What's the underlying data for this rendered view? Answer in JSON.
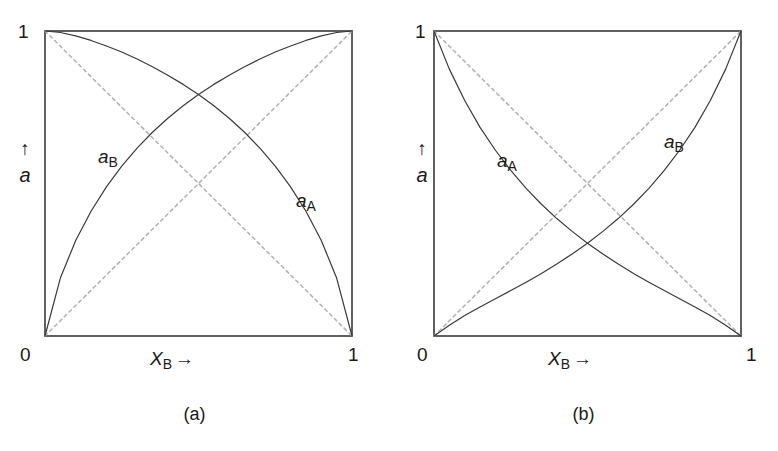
{
  "figure": {
    "background": "#ffffff",
    "ink_color": "#3a3a3a",
    "dashed_color": "#b0b0b0"
  },
  "panels": [
    {
      "id": "a",
      "caption": "(a)",
      "axes": {
        "x_label_var": "X",
        "x_label_sub": "B",
        "x_label_arrow": "→",
        "y_label_arrow": "↑",
        "y_label_var": "a",
        "x_tick_min": "0",
        "x_tick_max": "1",
        "y_tick_max": "1",
        "xlim": [
          0,
          1
        ],
        "ylim": [
          0,
          1
        ]
      },
      "curve_labels": [
        {
          "name": "a_B",
          "var": "a",
          "sub": "B",
          "x_px": 98,
          "y_px": 146
        },
        {
          "name": "a_A",
          "var": "a",
          "sub": "A",
          "x_px": 296,
          "y_px": 190
        }
      ]
    },
    {
      "id": "b",
      "caption": "(b)",
      "axes": {
        "x_label_var": "X",
        "x_label_sub": "B",
        "x_label_arrow": "→",
        "y_label_arrow": "↑",
        "y_label_var": "a",
        "x_tick_min": "0",
        "x_tick_max": "1",
        "y_tick_max": "1",
        "xlim": [
          0,
          1
        ],
        "ylim": [
          0,
          1
        ]
      },
      "curve_labels": [
        {
          "name": "a_A",
          "var": "a",
          "sub": "A",
          "x_px": 108,
          "y_px": 150
        },
        {
          "name": "a_B",
          "var": "a",
          "sub": "B",
          "x_px": 275,
          "y_px": 131
        }
      ]
    }
  ],
  "chart_data": [
    {
      "type": "line",
      "panel": "a",
      "title": "",
      "subtitle": "Positive deviation from Raoult's law",
      "xlabel": "X_B →",
      "ylabel": "a ↑",
      "xlim": [
        0,
        1
      ],
      "ylim": [
        0,
        1
      ],
      "xticks": [
        0,
        1
      ],
      "xticklabels": [
        "0",
        "1"
      ],
      "yticks": [
        0,
        1
      ],
      "yticklabels": [
        "",
        "1"
      ],
      "grid": false,
      "legend": "inline-curve-labels",
      "x": [
        0,
        0.05,
        0.1,
        0.15,
        0.2,
        0.25,
        0.3,
        0.35,
        0.4,
        0.45,
        0.5,
        0.55,
        0.6,
        0.65,
        0.7,
        0.75,
        0.8,
        0.85,
        0.9,
        0.95,
        1
      ],
      "series": [
        {
          "name": "a_A",
          "style": "solid",
          "values": [
            1,
            0.995,
            0.984,
            0.969,
            0.951,
            0.931,
            0.908,
            0.883,
            0.855,
            0.825,
            0.792,
            0.755,
            0.714,
            0.668,
            0.616,
            0.557,
            0.489,
            0.409,
            0.313,
            0.19,
            0
          ]
        },
        {
          "name": "a_B",
          "style": "solid",
          "values": [
            0,
            0.19,
            0.313,
            0.409,
            0.489,
            0.557,
            0.616,
            0.668,
            0.714,
            0.755,
            0.792,
            0.825,
            0.855,
            0.883,
            0.908,
            0.931,
            0.951,
            0.969,
            0.984,
            0.995,
            1
          ]
        },
        {
          "name": "Raoult ideal a_A",
          "style": "dashed",
          "values": [
            1,
            0.95,
            0.9,
            0.85,
            0.8,
            0.75,
            0.7,
            0.65,
            0.6,
            0.55,
            0.5,
            0.45,
            0.4,
            0.35,
            0.3,
            0.25,
            0.2,
            0.15,
            0.1,
            0.05,
            0
          ]
        },
        {
          "name": "Raoult ideal a_B",
          "style": "dashed",
          "values": [
            0,
            0.05,
            0.1,
            0.15,
            0.2,
            0.25,
            0.3,
            0.35,
            0.4,
            0.45,
            0.5,
            0.55,
            0.6,
            0.65,
            0.7,
            0.75,
            0.8,
            0.85,
            0.9,
            0.95,
            1
          ]
        }
      ],
      "annotations": [
        {
          "text": "a_B",
          "x": 0.17,
          "y": 0.62
        },
        {
          "text": "a_A",
          "x": 0.82,
          "y": 0.48
        }
      ],
      "crossing_point": {
        "x": 0.5,
        "y": 0.71
      }
    },
    {
      "type": "line",
      "panel": "b",
      "title": "",
      "subtitle": "Negative deviation from Raoult's law",
      "xlabel": "X_B →",
      "ylabel": "a ↑",
      "xlim": [
        0,
        1
      ],
      "ylim": [
        0,
        1
      ],
      "xticks": [
        0,
        1
      ],
      "xticklabels": [
        "0",
        "1"
      ],
      "yticks": [
        0,
        1
      ],
      "yticklabels": [
        "",
        "1"
      ],
      "grid": false,
      "legend": "inline-curve-labels",
      "x": [
        0,
        0.05,
        0.1,
        0.15,
        0.2,
        0.25,
        0.3,
        0.35,
        0.4,
        0.45,
        0.5,
        0.55,
        0.6,
        0.65,
        0.7,
        0.75,
        0.8,
        0.85,
        0.9,
        0.95,
        1
      ],
      "series": [
        {
          "name": "a_A",
          "style": "solid",
          "values": [
            1,
            0.875,
            0.772,
            0.684,
            0.609,
            0.543,
            0.484,
            0.432,
            0.385,
            0.343,
            0.304,
            0.269,
            0.236,
            0.205,
            0.176,
            0.149,
            0.122,
            0.095,
            0.067,
            0.035,
            0
          ]
        },
        {
          "name": "a_B",
          "style": "solid",
          "values": [
            0,
            0.035,
            0.067,
            0.095,
            0.122,
            0.149,
            0.176,
            0.205,
            0.236,
            0.269,
            0.304,
            0.343,
            0.385,
            0.432,
            0.484,
            0.543,
            0.609,
            0.684,
            0.772,
            0.875,
            1
          ]
        },
        {
          "name": "Raoult ideal a_A",
          "style": "dashed",
          "values": [
            1,
            0.95,
            0.9,
            0.85,
            0.8,
            0.75,
            0.7,
            0.65,
            0.6,
            0.55,
            0.5,
            0.45,
            0.4,
            0.35,
            0.3,
            0.25,
            0.2,
            0.15,
            0.1,
            0.05,
            0
          ]
        },
        {
          "name": "Raoult ideal a_B",
          "style": "dashed",
          "values": [
            0,
            0.05,
            0.1,
            0.15,
            0.2,
            0.25,
            0.3,
            0.35,
            0.4,
            0.45,
            0.5,
            0.55,
            0.6,
            0.65,
            0.7,
            0.75,
            0.8,
            0.85,
            0.9,
            0.95,
            1
          ]
        }
      ],
      "annotations": [
        {
          "text": "a_A",
          "x": 0.2,
          "y": 0.61
        },
        {
          "text": "a_B",
          "x": 0.74,
          "y": 0.66
        }
      ],
      "crossing_point": {
        "x": 0.5,
        "y": 0.28
      }
    }
  ]
}
